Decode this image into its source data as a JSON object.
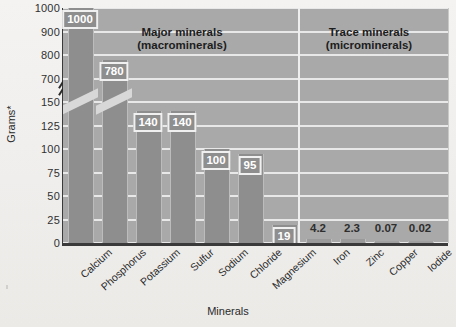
{
  "chart_data": {
    "type": "bar",
    "title": "",
    "xlabel": "Minerals",
    "ylabel": "Grams*",
    "categories": [
      "Calcium",
      "Phosphorus",
      "Potassium",
      "Sulfur",
      "Sodium",
      "Chloride",
      "Magnesium",
      "Iron",
      "Zinc",
      "Copper",
      "Iodide"
    ],
    "values": [
      1000,
      780,
      140,
      140,
      100,
      95,
      19,
      4.2,
      2.3,
      0.07,
      0.02
    ],
    "value_labels": [
      "1000",
      "780",
      "140",
      "140",
      "100",
      "95",
      "19",
      "4.2",
      "2.3",
      "0.07",
      "0.02"
    ],
    "yticks": [
      "1000",
      "900",
      "800",
      "700",
      "150",
      "125",
      "100",
      "75",
      "50",
      "25",
      "0"
    ],
    "ylim": [
      0,
      1000
    ],
    "axis_break": {
      "present": true,
      "between": [
        "700",
        "150"
      ]
    },
    "grid": "horizontal",
    "legend": "none",
    "annotations": [
      {
        "text": "Major minerals\n(macrominerals)",
        "group": [
          "Calcium",
          "Phosphorus",
          "Potassium",
          "Sulfur",
          "Sodium",
          "Chloride",
          "Magnesium"
        ]
      },
      {
        "text": "Trace minerals\n(microminerals)",
        "group": [
          "Iron",
          "Zinc",
          "Copper",
          "Iodide"
        ]
      }
    ]
  },
  "axes": {
    "y_title": "Grams*",
    "x_title": "Minerals"
  },
  "sections": {
    "major": "Major minerals\n(macrominerals)",
    "trace": "Trace minerals\n(microminerals)"
  },
  "colors": {
    "plot_background": "#a9a9a9",
    "bar_fill": "#8e8e8e",
    "gridline": "#e8e8e8",
    "axis": "#3a3a3a",
    "label_text": "#ffffff",
    "paper": "#f2f1ef"
  }
}
